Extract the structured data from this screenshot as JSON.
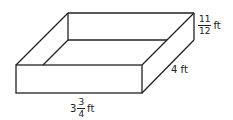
{
  "figure": {
    "type": "open rectangular box",
    "height": {
      "numerator": "11",
      "denominator": "12",
      "unit": "ft"
    },
    "width": {
      "value": "4",
      "unit": "ft",
      "text": "4 ft"
    },
    "length": {
      "whole": "3",
      "numerator": "3",
      "denominator": "4",
      "unit": "ft"
    }
  }
}
